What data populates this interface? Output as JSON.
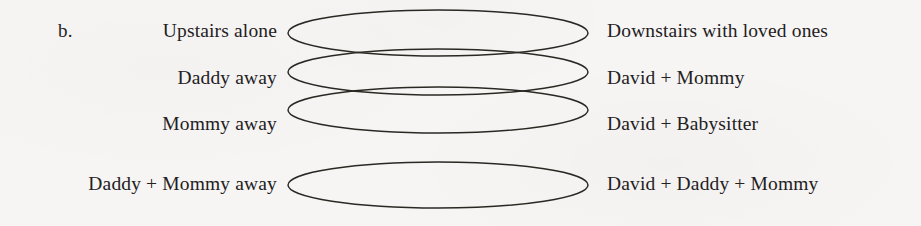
{
  "figure": {
    "panel_letter": "b.",
    "background_color": "#f6f5f3",
    "ink_color": "#23201e",
    "stroke_color": "#2b2824"
  },
  "rows": [
    {
      "left_label": "Upstairs alone",
      "right_label": "Downstairs with loved ones"
    },
    {
      "left_label": "Daddy away",
      "right_label": "David + Mommy"
    },
    {
      "left_label": "Mommy away",
      "right_label": "David + Babysitter"
    },
    {
      "left_label": "Daddy + Mommy away",
      "right_label": "David + Daddy + Mommy"
    }
  ],
  "chart_data": {
    "type": "diagram",
    "title": "",
    "shape": "ellipse",
    "shape_count": 4,
    "ellipses": [
      {
        "index": 0,
        "cx": 438,
        "cy": 33,
        "rx": 150,
        "ry": 23
      },
      {
        "index": 1,
        "cx": 438,
        "cy": 72,
        "rx": 150,
        "ry": 23
      },
      {
        "index": 2,
        "cx": 438,
        "cy": 110,
        "rx": 150,
        "ry": 23
      },
      {
        "index": 3,
        "cx": 438,
        "cy": 185,
        "rx": 150,
        "ry": 23
      }
    ],
    "left_labels": [
      "Upstairs alone",
      "Daddy away",
      "Mommy away",
      "Daddy + Mommy away"
    ],
    "right_labels": [
      "Downstairs with loved ones",
      "David + Mommy",
      "David + Babysitter",
      "David + Daddy + Mommy"
    ],
    "legend": [],
    "grid": false
  }
}
